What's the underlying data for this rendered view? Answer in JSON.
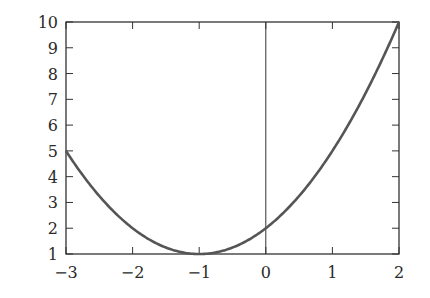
{
  "chart_data": {
    "type": "line",
    "title": "",
    "xlabel": "",
    "ylabel": "",
    "xlim": [
      -3,
      2
    ],
    "ylim": [
      1,
      10
    ],
    "grid": false,
    "legend": null,
    "function": "f(x) = (x+1)^2 + 1",
    "x_ticks": [
      "−3",
      "−2",
      "−1",
      "0",
      "1",
      "2"
    ],
    "y_ticks": [
      "1",
      "2",
      "3",
      "4",
      "5",
      "6",
      "7",
      "8",
      "9",
      "10"
    ],
    "series": [
      {
        "name": "f(x)",
        "x": [
          -3,
          -2.5,
          -2,
          -1.5,
          -1,
          -0.5,
          0,
          0.5,
          1,
          1.5,
          2
        ],
        "y": [
          5,
          3.25,
          2,
          1.25,
          1,
          1.25,
          2,
          3.25,
          5,
          7.25,
          10
        ]
      }
    ],
    "annotations": [
      {
        "type": "vertical-line",
        "x": 0
      }
    ],
    "colors": {
      "curve": "#555555",
      "axes": "#333333"
    }
  }
}
